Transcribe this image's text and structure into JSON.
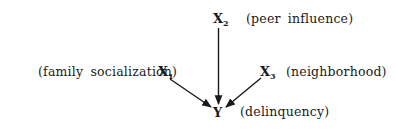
{
  "diagram": {
    "type": "causal-path-diagram",
    "nodes": [
      {
        "id": "x1",
        "symbol": "X",
        "subscript": "1",
        "label": "(family socialization)"
      },
      {
        "id": "x2",
        "symbol": "X",
        "subscript": "2",
        "label": "(peer influence)"
      },
      {
        "id": "x3",
        "symbol": "X",
        "subscript": "3",
        "label": "(neighborhood)"
      },
      {
        "id": "y",
        "symbol": "Y",
        "subscript": "",
        "label": "(delinquency)"
      }
    ],
    "edges": [
      {
        "from": "x1",
        "to": "y"
      },
      {
        "from": "x2",
        "to": "y"
      },
      {
        "from": "x3",
        "to": "y"
      }
    ],
    "colors": {
      "ink": "#1a1a1a",
      "background": "#ffffff"
    }
  }
}
